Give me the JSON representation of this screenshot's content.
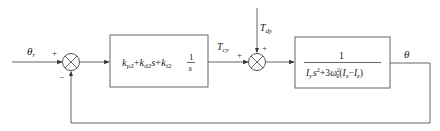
{
  "diagram": {
    "type": "control-block-diagram",
    "input_signal": "θr",
    "input_signal_base": "θ",
    "input_signal_sub": "r",
    "output_signal": "θ",
    "disturbance_base": "T",
    "disturbance_sub": "dy",
    "control_torque_base": "T",
    "control_torque_sub": "cy",
    "summing_junction_1": {
      "name": "error-summing-junction",
      "sign_reference": "+",
      "sign_feedback": "−"
    },
    "summing_junction_2": {
      "name": "disturbance-summing-junction",
      "sign_control": "+",
      "sign_disturbance": "+"
    },
    "controller_block": {
      "label": "PID controller",
      "k_p": "k",
      "k_p_sub": "p2",
      "plus1": "+",
      "k_d": "k",
      "k_d_sub": "d2",
      "s_var": "s",
      "plus2": "+",
      "k_i": "k",
      "k_i_sub": "i2",
      "frac_num": "1",
      "frac_den": "s"
    },
    "plant_block": {
      "label": "pitch dynamics",
      "numerator": "1",
      "den_Iy": "I",
      "den_Iy_sub": "y",
      "den_s": "s",
      "den_s_exp": "2",
      "den_plus": "+3",
      "den_omega": "ω",
      "den_omega_sup": "2",
      "den_omega_sub": "0",
      "den_paren_open": "(",
      "den_Ix": "I",
      "den_Ix_sub": "x",
      "den_minus": "−",
      "den_Iz": "I",
      "den_Iz_sub": "z",
      "den_paren_close": ")"
    }
  }
}
